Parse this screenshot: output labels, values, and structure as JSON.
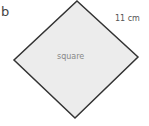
{
  "part_label": "b",
  "shape": {
    "name": "square",
    "side_label": "11 cm",
    "fill": "#ececec",
    "stroke": "#333333",
    "vertices": [
      [
        77,
        1
      ],
      [
        138,
        57
      ],
      [
        75,
        118
      ],
      [
        14,
        60
      ]
    ]
  }
}
